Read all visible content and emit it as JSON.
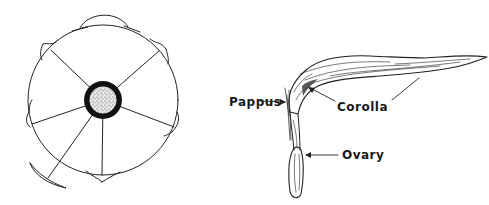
{
  "figure": {
    "type": "botanical line drawing",
    "left_panel": {
      "subject": "floral-diagram-cross-section",
      "radial_segments": 6
    },
    "right_panel": {
      "subject": "ray-floret",
      "labels": {
        "pappus": "Pappus",
        "corolla": "Corolla",
        "ovary": "Ovary"
      }
    },
    "colors": {
      "ink": "#222222",
      "background": "#ffffff"
    }
  }
}
